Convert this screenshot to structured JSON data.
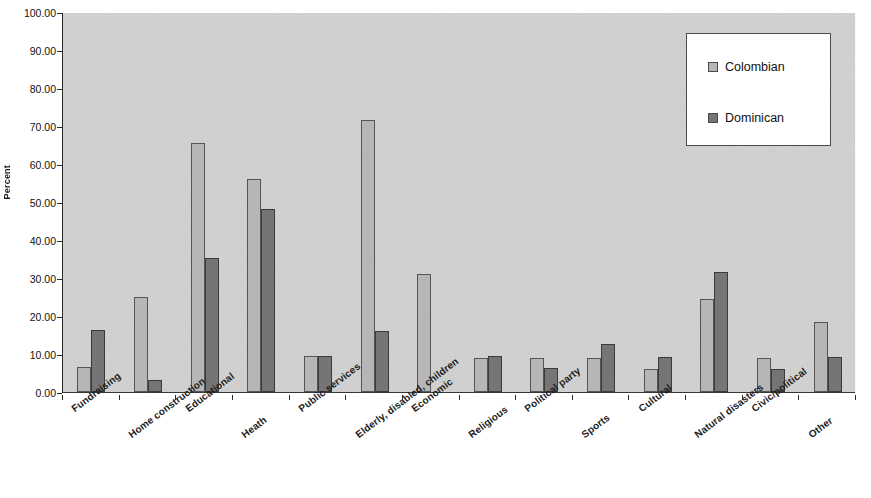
{
  "chart_data": {
    "type": "bar",
    "title": "",
    "xlabel": "",
    "ylabel": "Percent",
    "ylim": [
      0,
      100
    ],
    "ytick_labels": [
      "100.00",
      "90.00",
      "80.00",
      "70.00",
      "60.00",
      "50.00",
      "40.00",
      "30.00",
      "20.00",
      "10.00",
      "0.00"
    ],
    "ytick_values": [
      100,
      90,
      80,
      70,
      60,
      50,
      40,
      30,
      20,
      10,
      0
    ],
    "grid": false,
    "legend_position": "top-right",
    "categories": [
      "Fundraising",
      "Home construction",
      "Educational",
      "Heath",
      "Public services",
      "Elderly, disabled, children",
      "Economic",
      "Religious",
      "Political party",
      "Sports",
      "Cultural",
      "Natural disasters",
      "Civic/political",
      "Other"
    ],
    "series": [
      {
        "name": "Colombian",
        "color": "#b6b6b6",
        "values": [
          6.5,
          25.0,
          65.5,
          56.0,
          9.5,
          71.5,
          31.0,
          9.0,
          9.0,
          9.0,
          6.0,
          24.5,
          9.0,
          18.3
        ]
      },
      {
        "name": "Dominican",
        "color": "#757575",
        "values": [
          16.2,
          3.2,
          35.3,
          48.2,
          9.5,
          16.0,
          0.0,
          9.4,
          6.3,
          12.7,
          9.3,
          31.5,
          6.0,
          9.3
        ]
      }
    ]
  }
}
